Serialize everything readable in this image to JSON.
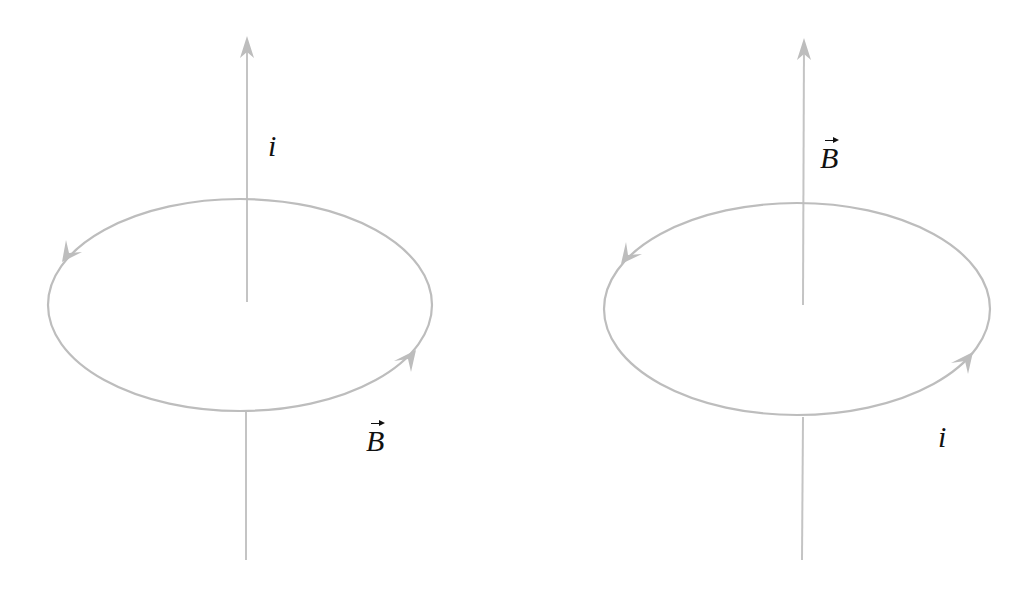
{
  "figure": {
    "background": "#ffffff",
    "stroke_color": "#bdbdbd",
    "label_color": "#111111",
    "panels": [
      {
        "id": "left",
        "description": "Straight current i upward through loop; circular magnetic field B around it",
        "axis_label": "i",
        "loop_label": "B",
        "axis_label_is_vector": false,
        "loop_label_is_vector": true
      },
      {
        "id": "right",
        "description": "Circular current loop i produces magnetic field B along axis",
        "axis_label": "B",
        "loop_label": "i",
        "axis_label_is_vector": true,
        "loop_label_is_vector": false
      }
    ]
  }
}
